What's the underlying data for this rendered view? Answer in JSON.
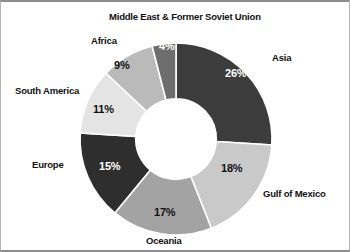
{
  "chart_data": {
    "type": "pie",
    "variant": "donut",
    "title": "",
    "start_angle_deg": 0,
    "direction": "clockwise",
    "hole_ratio": 0.42,
    "unit": "%",
    "categories": [
      "Asia",
      "Gulf of Mexico",
      "Oceania",
      "Europe",
      "South America",
      "Africa",
      "Middle East & Former Soviet Union"
    ],
    "values": [
      26,
      18,
      17,
      15,
      11,
      9,
      4
    ],
    "slices": [
      {
        "label": "Asia",
        "value": 26,
        "value_text": "26%",
        "color": "#3c3c3c",
        "text_color": "#ffffff"
      },
      {
        "label": "Gulf of Mexico",
        "value": 18,
        "value_text": "18%",
        "color": "#c9c9c9",
        "text_color": "#111111"
      },
      {
        "label": "Oceania",
        "value": 17,
        "value_text": "17%",
        "color": "#a3a3a3",
        "text_color": "#111111"
      },
      {
        "label": "Europe",
        "value": 15,
        "value_text": "15%",
        "color": "#2e2e2e",
        "text_color": "#ffffff"
      },
      {
        "label": "South America",
        "value": 11,
        "value_text": "11%",
        "color": "#e4e4e4",
        "text_color": "#111111"
      },
      {
        "label": "Africa",
        "value": 9,
        "value_text": "9%",
        "color": "#bababa",
        "text_color": "#111111"
      },
      {
        "label": "Middle East & Former Soviet Union",
        "value": 4,
        "value_text": "4%",
        "color": "#6e6e6e",
        "text_color": "#ffffff"
      }
    ],
    "legend_position": "outside-labels",
    "grid": false,
    "colors": {
      "background": "#ffffff",
      "border": "#8c8c8c",
      "slice_separator": "#ffffff",
      "hole": "#ffffff"
    }
  }
}
